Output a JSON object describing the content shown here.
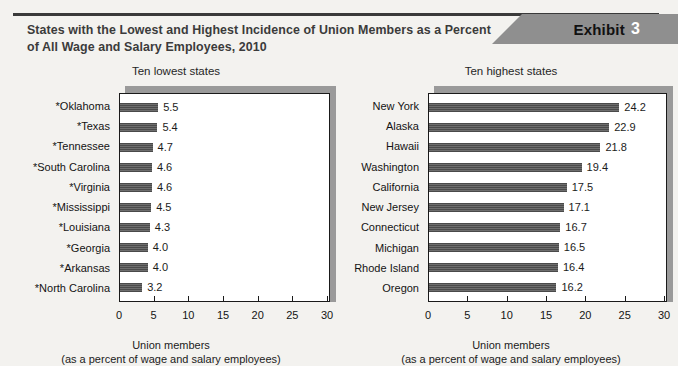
{
  "exhibit": {
    "label": "Exhibit",
    "number": "3"
  },
  "title": "States with the Lowest and Highest Incidence of Union Members as a Percent of All Wage and Salary Employees, 2010",
  "colors": {
    "page_background": "#f3f2ef",
    "banner": "#8f8f8f",
    "bar": "#555555",
    "title_text": "#3b3b3b",
    "rule": "#3a3a3a",
    "plot_shadow": "#9a9a9a"
  },
  "chart_data": [
    {
      "type": "bar",
      "orientation": "horizontal",
      "title": "Ten lowest states",
      "xlabel": "Union members",
      "xlabel_sub": "(as a percent of wage and salary employees)",
      "ylabel": "",
      "xlim": [
        0,
        30
      ],
      "xticks": [
        0,
        5,
        10,
        15,
        20,
        25,
        30
      ],
      "xtick_labels": [
        "0",
        "5",
        "10",
        "15",
        "20",
        "25",
        "30"
      ],
      "grid": false,
      "legend": false,
      "categories": [
        "*Oklahoma",
        "*Texas",
        "*Tennessee",
        "*South Carolina",
        "*Virginia",
        "*Mississippi",
        "*Louisiana",
        "*Georgia",
        "*Arkansas",
        "*North Carolina"
      ],
      "values": [
        5.5,
        5.4,
        4.7,
        4.6,
        4.6,
        4.5,
        4.3,
        4.0,
        4.0,
        3.2
      ],
      "value_labels": [
        "5.5",
        "5.4",
        "4.7",
        "4.6",
        "4.6",
        "4.5",
        "4.3",
        "4.0",
        "4.0",
        "3.2"
      ]
    },
    {
      "type": "bar",
      "orientation": "horizontal",
      "title": "Ten highest states",
      "xlabel": "Union members",
      "xlabel_sub": "(as a percent of wage and salary employees)",
      "ylabel": "",
      "xlim": [
        0,
        30
      ],
      "xticks": [
        0,
        5,
        10,
        15,
        20,
        25,
        30
      ],
      "xtick_labels": [
        "0",
        "5",
        "10",
        "15",
        "20",
        "25",
        "30"
      ],
      "grid": false,
      "legend": false,
      "categories": [
        "New York",
        "Alaska",
        "Hawaii",
        "Washington",
        "California",
        "New Jersey",
        "Connecticut",
        "Michigan",
        "Rhode Island",
        "Oregon"
      ],
      "values": [
        24.2,
        22.9,
        21.8,
        19.4,
        17.5,
        17.1,
        16.7,
        16.5,
        16.4,
        16.2
      ],
      "value_labels": [
        "24.2",
        "22.9",
        "21.8",
        "19.4",
        "17.5",
        "17.1",
        "16.7",
        "16.5",
        "16.4",
        "16.2"
      ]
    }
  ]
}
